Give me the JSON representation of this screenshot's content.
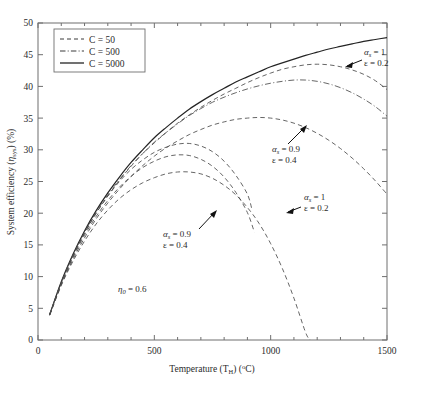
{
  "chart_data": {
    "type": "line",
    "title": "",
    "xlabel": "Temperature (T_H) (°C)",
    "ylabel": "System efficiency (η_sys) (%)",
    "xlim": [
      0,
      1500
    ],
    "ylim": [
      0,
      50
    ],
    "xticks": [
      0,
      500,
      1000,
      1500
    ],
    "yticks": [
      0,
      5,
      10,
      15,
      20,
      25,
      30,
      35,
      40,
      45,
      50
    ],
    "grid": false,
    "legend_position": "top-left",
    "legend_entries": [
      {
        "label": "C = 50",
        "style": "dashed"
      },
      {
        "label": "C = 500",
        "style": "dashdot"
      },
      {
        "label": "C = 5000",
        "style": "solid"
      }
    ],
    "series": [
      {
        "name": "C = 5000, alpha_s = 1, epsilon = 0.2",
        "style": "solid",
        "concentration": 5000,
        "alpha_s": 1,
        "epsilon": 0.2,
        "x": [
          50,
          100,
          150,
          200,
          250,
          300,
          350,
          400,
          450,
          500,
          550,
          600,
          650,
          700,
          750,
          800,
          850,
          900,
          950,
          1000,
          1050,
          1100,
          1150,
          1200,
          1250,
          1300,
          1350,
          1400,
          1450,
          1500
        ],
        "y": [
          4.0,
          9.2,
          13.5,
          17.2,
          20.4,
          23.2,
          25.7,
          28.0,
          30.0,
          31.9,
          33.5,
          35.0,
          36.4,
          37.6,
          38.7,
          39.7,
          40.7,
          41.5,
          42.3,
          43.1,
          43.7,
          44.3,
          44.9,
          45.4,
          45.9,
          46.3,
          46.7,
          47.1,
          47.4,
          47.7
        ]
      },
      {
        "name": "C = 500, alpha_s = 1, epsilon = 0.2",
        "style": "dashdot",
        "concentration": 500,
        "alpha_s": 1,
        "epsilon": 0.2,
        "x": [
          50,
          100,
          150,
          200,
          250,
          300,
          350,
          400,
          450,
          500,
          550,
          600,
          650,
          700,
          750,
          800,
          850,
          900,
          950,
          1000,
          1050,
          1100,
          1150,
          1200,
          1250,
          1300,
          1350,
          1400,
          1450,
          1500
        ],
        "y": [
          4.0,
          9.1,
          13.4,
          17.0,
          20.2,
          22.9,
          25.3,
          27.5,
          29.4,
          31.2,
          32.7,
          34.1,
          35.4,
          36.5,
          37.5,
          38.3,
          39.0,
          39.6,
          40.1,
          40.5,
          40.8,
          41.0,
          41.0,
          40.8,
          40.4,
          39.8,
          39.0,
          38.0,
          36.8,
          35.3
        ]
      },
      {
        "name": "C = 500, alpha_s = 0.9, epsilon = 0.4",
        "style": "dashed",
        "concentration": 500,
        "alpha_s": 0.9,
        "epsilon": 0.4,
        "x": [
          50,
          100,
          150,
          200,
          250,
          300,
          350,
          400,
          450,
          500,
          550,
          600,
          650,
          700,
          750,
          800,
          850,
          900,
          950,
          1000,
          1050,
          1100,
          1150,
          1200,
          1250,
          1300,
          1350,
          1400,
          1450,
          1500
        ],
        "y": [
          3.9,
          8.7,
          12.7,
          16.1,
          19.1,
          21.6,
          23.8,
          25.8,
          27.5,
          29.0,
          30.3,
          31.4,
          32.4,
          33.2,
          33.9,
          34.4,
          34.8,
          35.0,
          35.1,
          35.0,
          34.7,
          34.2,
          33.5,
          32.6,
          31.5,
          30.2,
          28.7,
          27.0,
          25.1,
          23.0
        ]
      },
      {
        "name": "C = 5000 family upper dashed, alpha_s = 0.9, epsilon = 0.4",
        "style": "dashed",
        "concentration": 5000,
        "alpha_s": 0.9,
        "epsilon": 0.4,
        "x": [
          50,
          100,
          150,
          200,
          250,
          300,
          350,
          400,
          450,
          500,
          550,
          600,
          650,
          700,
          750,
          800,
          850,
          900,
          950,
          1000,
          1050,
          1100,
          1150,
          1200,
          1250,
          1300,
          1350,
          1400,
          1450,
          1500
        ],
        "y": [
          4.0,
          9.0,
          13.2,
          16.8,
          20.0,
          22.7,
          25.2,
          27.4,
          29.4,
          31.1,
          32.7,
          34.2,
          35.5,
          36.7,
          37.8,
          38.8,
          39.7,
          40.6,
          41.4,
          42.1,
          42.7,
          43.1,
          43.4,
          43.5,
          43.4,
          43.1,
          42.6,
          41.9,
          40.9,
          39.5
        ]
      },
      {
        "name": "C = 50, alpha_s = 1, epsilon = 0.2",
        "style": "dashed",
        "concentration": 50,
        "alpha_s": 1,
        "epsilon": 0.2,
        "x": [
          50,
          100,
          150,
          200,
          250,
          300,
          350,
          400,
          450,
          500,
          550,
          600,
          650,
          700,
          750,
          800,
          850,
          900,
          950,
          1000,
          1050,
          1100,
          1150,
          1170
        ],
        "y": [
          3.9,
          8.6,
          12.4,
          15.6,
          18.3,
          20.5,
          22.3,
          23.7,
          24.8,
          25.6,
          26.2,
          26.5,
          26.5,
          26.2,
          25.5,
          24.4,
          22.9,
          20.9,
          18.4,
          15.2,
          11.3,
          6.6,
          1.2,
          0.0
        ]
      },
      {
        "name": "C = 50 mid dashed, alpha_s = 1, epsilon = 0.2",
        "style": "dashed",
        "concentration": 50,
        "alpha_s": 1,
        "epsilon": 0.2,
        "x": [
          50,
          100,
          150,
          200,
          250,
          300,
          350,
          400,
          450,
          500,
          550,
          600,
          650,
          700,
          750,
          800,
          850,
          900,
          930
        ],
        "y": [
          4.0,
          8.9,
          13.0,
          16.5,
          19.5,
          22.0,
          24.1,
          25.8,
          27.2,
          28.2,
          28.9,
          29.2,
          29.1,
          28.5,
          27.4,
          25.7,
          23.3,
          20.1,
          17.0
        ]
      },
      {
        "name": "C = 50, alpha_s = 0.9, epsilon = 0.4 (peak 31)",
        "style": "dashed",
        "concentration": 50,
        "alpha_s": 0.9,
        "epsilon": 0.4,
        "x": [
          50,
          100,
          150,
          200,
          250,
          300,
          350,
          400,
          450,
          500,
          550,
          600,
          650,
          700,
          750,
          800,
          850,
          900,
          920
        ],
        "y": [
          4.0,
          9.0,
          13.2,
          16.9,
          20.0,
          22.7,
          25.0,
          26.9,
          28.4,
          29.6,
          30.4,
          30.9,
          31.0,
          30.6,
          29.7,
          28.2,
          26.0,
          23.0,
          20.5
        ]
      }
    ],
    "annotations": [
      {
        "id": "annot-1",
        "line1": "α",
        "sub1": "s",
        "eq1": " = 1",
        "line2": "ε = 0.2",
        "target": "C = 500 upper curve"
      },
      {
        "id": "annot-2",
        "line1": "α",
        "sub1": "s",
        "eq1": " = 0.9",
        "line2": "ε = 0.4",
        "target": "C = 500 lower curve"
      },
      {
        "id": "annot-3",
        "line1": "α",
        "sub1": "s",
        "eq1": " = 1",
        "line2": "ε = 0.2",
        "target": "C = 50 curve"
      },
      {
        "id": "annot-4",
        "line1": "α",
        "sub1": "s",
        "eq1": " = 0.9",
        "line2": "ε = 0.4",
        "target": "C = 50 curve"
      },
      {
        "id": "annot-eta",
        "text": "η",
        "sub": "0",
        "value": " = 0.6"
      }
    ]
  },
  "axes": {
    "x_label_text": "Temperature (T",
    "x_label_sub": "H",
    "x_label_tail": ") (",
    "x_label_deg": "o",
    "x_label_unit": "C)",
    "y_label_head": "System efficiency (",
    "y_label_eta": "η",
    "y_label_sub": "sys",
    "y_label_tail": ") (%)",
    "xticks": [
      "0",
      "500",
      "1000",
      "1500"
    ],
    "yticks": [
      "0",
      "5",
      "10",
      "15",
      "20",
      "25",
      "30",
      "35",
      "40",
      "45",
      "50"
    ]
  },
  "legend": {
    "items": [
      {
        "label": "C = 50"
      },
      {
        "label": "C = 500"
      },
      {
        "label": "C = 5000"
      }
    ]
  },
  "annotations": {
    "a1": {
      "alpha": "α",
      "sub": "s",
      "eq": " = 1",
      "eps": "ε = 0.2"
    },
    "a2": {
      "alpha": "α",
      "sub": "s",
      "eq": " = 0.9",
      "eps": "ε = 0.4"
    },
    "a3": {
      "alpha": "α",
      "sub": "s",
      "eq": " = 1",
      "eps": "ε = 0.2"
    },
    "a4": {
      "alpha": "α",
      "sub": "s",
      "eq": " = 0.9",
      "eps": "ε = 0.4"
    },
    "eta": {
      "sym": "η",
      "sub": "0",
      "val": " = 0.6"
    }
  },
  "colors": {
    "axis": "#6f6f6f",
    "curve": "#4a4a4a",
    "curve_bold": "#242424",
    "text": "#2b2b2b",
    "background": "#ffffff"
  }
}
